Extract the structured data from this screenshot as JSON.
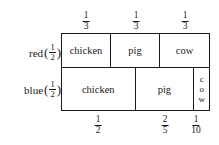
{
  "row_labels": [
    {
      "id": "red",
      "name": "red",
      "open_paren": "(",
      "close_paren": ")",
      "fraction": {
        "numerator": "1",
        "denominator": "2"
      }
    },
    {
      "id": "blue",
      "name": "blue",
      "open_paren": "(",
      "close_paren": ")",
      "fraction": {
        "numerator": "1",
        "denominator": "2"
      }
    }
  ],
  "top_labels": [
    {
      "numerator": "1",
      "denominator": "3"
    },
    {
      "numerator": "1",
      "denominator": "3"
    },
    {
      "numerator": "1",
      "denominator": "3"
    }
  ],
  "bottom_labels": [
    {
      "numerator": "1",
      "denominator": "2"
    },
    {
      "numerator": "2",
      "denominator": "5"
    },
    {
      "numerator": "1",
      "denominator": "10"
    }
  ],
  "rows": [
    {
      "id": "red",
      "cells": [
        {
          "label": "chicken",
          "orientation": "horizontal"
        },
        {
          "label": "pig",
          "orientation": "horizontal"
        },
        {
          "label": "cow",
          "orientation": "horizontal"
        }
      ]
    },
    {
      "id": "blue",
      "cells": [
        {
          "label": "chicken",
          "orientation": "horizontal"
        },
        {
          "label": "pig",
          "orientation": "horizontal"
        },
        {
          "label": "cow",
          "orientation": "vertical",
          "letters": "c\no\nw"
        }
      ]
    }
  ],
  "colors": {
    "ink": "#1a1a1a",
    "background": "#ffffff"
  }
}
